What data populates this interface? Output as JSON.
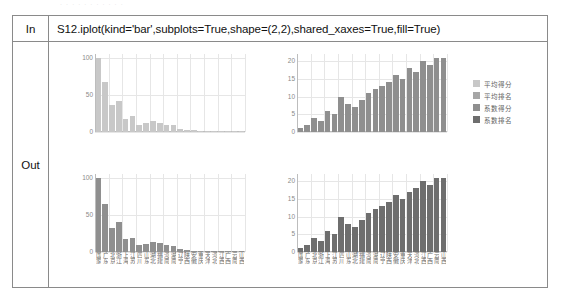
{
  "top_faint_text": "· · · · · · · · · · ·",
  "notebook": {
    "in_label": "In",
    "out_label": "Out",
    "code": "S12.iplot(kind='bar',subplots=True,shape=(2,2),shared_xaxes=True,fill=True)"
  },
  "legend": {
    "items": [
      {
        "label": "平均得分",
        "color": "#c8c8c8"
      },
      {
        "label": "平均排名",
        "color": "#a6a6a6"
      },
      {
        "label": "系数得分",
        "color": "#8f8f8f"
      },
      {
        "label": "系数排名",
        "color": "#6e6e6e"
      }
    ]
  },
  "categories": [
    "国家",
    "广东",
    "北京",
    "浙江",
    "上海",
    "江苏",
    "四川",
    "山东",
    "湖北",
    "福建",
    "河南",
    "湖南",
    "辽宁",
    "陕西",
    "安徽",
    "重庆",
    "天津",
    "河北",
    "江西",
    "广西",
    "云南",
    "山西"
  ],
  "chart_data": [
    {
      "type": "bar",
      "title": "平均得分",
      "id": "top-left",
      "xlabel": "",
      "ylabel": "",
      "ylim": [
        0,
        105
      ],
      "yticks": [
        0,
        50,
        100
      ],
      "grid": true,
      "color": "#c8c8c8",
      "categories": [
        "国家",
        "广东",
        "北京",
        "浙江",
        "上海",
        "江苏",
        "四川",
        "山东",
        "湖北",
        "福建",
        "河南",
        "湖南",
        "辽宁",
        "陕西",
        "安徽",
        "重庆",
        "天津",
        "河北",
        "江西",
        "广西",
        "云南",
        "山西"
      ],
      "values": [
        100,
        68,
        36,
        42,
        18,
        21,
        10,
        12,
        15,
        12,
        10,
        9,
        4,
        3,
        3,
        2,
        2,
        2,
        1,
        1,
        1,
        1
      ]
    },
    {
      "type": "bar",
      "title": "平均排名",
      "id": "top-right",
      "xlabel": "",
      "ylabel": "",
      "ylim": [
        0,
        22
      ],
      "yticks": [
        0,
        5,
        10,
        15,
        20
      ],
      "grid": true,
      "color": "#8f8f8f",
      "categories": [
        "国家",
        "广东",
        "北京",
        "浙江",
        "上海",
        "江苏",
        "四川",
        "山东",
        "湖北",
        "福建",
        "河南",
        "湖南",
        "辽宁",
        "陕西",
        "安徽",
        "重庆",
        "天津",
        "河北",
        "江西",
        "广西",
        "云南",
        "山西"
      ],
      "values": [
        1,
        2,
        4,
        3,
        6,
        5,
        10,
        8,
        7,
        9,
        11,
        12,
        13,
        14,
        16,
        15,
        18,
        17,
        20,
        19,
        21,
        21
      ]
    },
    {
      "type": "bar",
      "title": "系数得分",
      "id": "bottom-left",
      "xlabel": "",
      "ylabel": "",
      "ylim": [
        0,
        105
      ],
      "yticks": [
        0,
        50,
        100
      ],
      "grid": true,
      "color": "#8f8f8f",
      "categories": [
        "国家",
        "广东",
        "北京",
        "浙江",
        "上海",
        "江苏",
        "四川",
        "山东",
        "湖北",
        "福建",
        "河南",
        "湖南",
        "辽宁",
        "陕西",
        "安徽",
        "重庆",
        "天津",
        "河北",
        "江西",
        "广西",
        "云南",
        "山西"
      ],
      "values": [
        100,
        64,
        33,
        41,
        17,
        19,
        9,
        11,
        14,
        12,
        9,
        8,
        4,
        3,
        2,
        2,
        2,
        1,
        1,
        1,
        1,
        1
      ]
    },
    {
      "type": "bar",
      "title": "系数排名",
      "id": "bottom-right",
      "xlabel": "",
      "ylabel": "",
      "ylim": [
        0,
        22
      ],
      "yticks": [
        0,
        5,
        10,
        15,
        20
      ],
      "grid": true,
      "color": "#6e6e6e",
      "categories": [
        "国家",
        "广东",
        "北京",
        "浙江",
        "上海",
        "江苏",
        "四川",
        "山东",
        "湖北",
        "福建",
        "河南",
        "湖南",
        "辽宁",
        "陕西",
        "安徽",
        "重庆",
        "天津",
        "河北",
        "江西",
        "广西",
        "云南",
        "山西"
      ],
      "values": [
        1,
        2,
        4,
        3,
        6,
        5,
        10,
        8,
        7,
        9,
        11,
        12,
        13,
        14,
        16,
        15,
        17,
        18,
        20,
        19,
        21,
        21
      ]
    }
  ]
}
